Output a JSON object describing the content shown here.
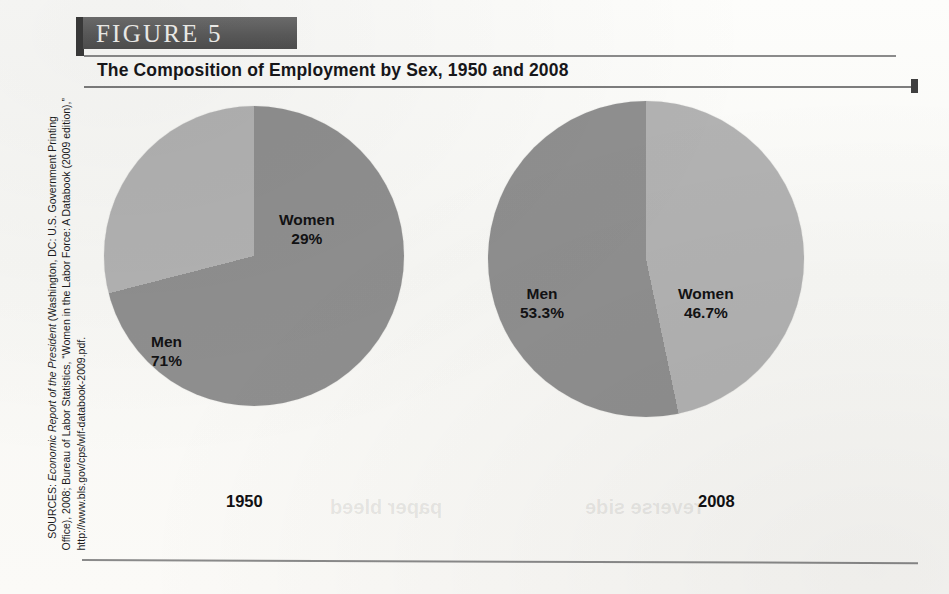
{
  "figure": {
    "label": "FIGURE  5",
    "title": "The Composition of Employment by Sex, 1950 and 2008"
  },
  "sources": {
    "prefix": "SOURCES: ",
    "italic": "Economic Report of the President",
    "rest": " (Washington, DC: U.S. Government Printing Office), 2008; Bureau of Labor Statistics, “Women in the Labor Force: A Databook (2009 edition),” http://www.bls.gov/cps/wlf-databook-2009.pdf."
  },
  "colors": {
    "men": "#8f8f8f",
    "women": "#b2b2b2",
    "banner": "#5b5b5b",
    "banner_tab": "#3a3a3a",
    "rule": "#8b8b8b",
    "text": "#121214"
  },
  "ghost_text": {
    "left": "paper bleed",
    "right": "reverse side"
  },
  "chart_data": [
    {
      "type": "pie",
      "title": "1950",
      "categories": [
        "Men",
        "Women"
      ],
      "values": [
        71,
        29
      ],
      "value_labels": [
        "71%",
        "29%"
      ],
      "colors": [
        "#8f8f8f",
        "#b2b2b2"
      ],
      "start_angle_deg": 0,
      "direction": "clockwise",
      "legend": "none",
      "labels_inside": true
    },
    {
      "type": "pie",
      "title": "2008",
      "categories": [
        "Men",
        "Women"
      ],
      "values": [
        53.3,
        46.7
      ],
      "value_labels": [
        "53.3%",
        "46.7%"
      ],
      "colors": [
        "#8f8f8f",
        "#b2b2b2"
      ],
      "start_angle_deg": 0,
      "direction": "counterclockwise",
      "legend": "none",
      "labels_inside": true
    }
  ]
}
